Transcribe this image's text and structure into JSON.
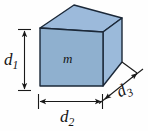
{
  "figure": {
    "type": "3d-rectangular-prism-diagram",
    "background_color": "#fefefe"
  },
  "solid": {
    "name": "rectangular-box",
    "face_colors": {
      "front": "#8fb0cf",
      "top": "#9cbadb",
      "right": "#9bbada"
    },
    "edge_color": "#1b2838",
    "edge_width": 1.4,
    "mass_label": "m"
  },
  "labels": {
    "height": {
      "base": "d",
      "subscript": "1",
      "full": "d1",
      "axis": "vertical",
      "position": "left"
    },
    "width": {
      "base": "d",
      "subscript": "2",
      "full": "d2",
      "axis": "horizontal",
      "position": "bottom"
    },
    "depth": {
      "base": "d",
      "subscript": "3",
      "full": "d3",
      "axis": "diagonal",
      "position": "bottom-right"
    },
    "mass": {
      "base": "m",
      "subscript": "",
      "full": "m",
      "axis": "none",
      "position": "front-face-center"
    }
  },
  "dimension_lines": [
    {
      "name": "d1-dimension-line",
      "orientation": "vertical",
      "arrowheads": "both",
      "color": "#1a1a1a"
    },
    {
      "name": "d2-dimension-line",
      "orientation": "horizontal",
      "arrowheads": "both",
      "color": "#1a1a1a"
    },
    {
      "name": "d3-dimension-line",
      "orientation": "diagonal",
      "arrowheads": "both",
      "color": "#1a1a1a"
    }
  ],
  "colors": {
    "face_front": "#8fb0cf",
    "face_top": "#9cbadb",
    "face_right": "#9bbada",
    "edge": "#1b2838",
    "annotation": "#1a1a1a",
    "text": "#141414"
  }
}
